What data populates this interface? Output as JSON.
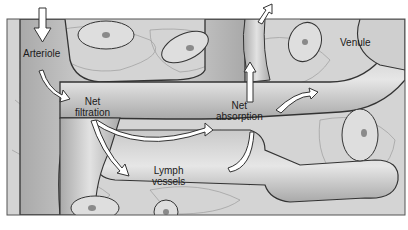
{
  "diagram": {
    "type": "capillary-bed",
    "labels": {
      "arteriole": "Arteriole",
      "net_filtration_1": "Net",
      "net_filtration_2": "filtration",
      "net_absorption_1": "Net",
      "net_absorption_2": "absorption",
      "lymph_1": "Lymph",
      "lymph_2": "vessels",
      "venule": "Venule"
    },
    "colors": {
      "tissue": "#d6d6d6",
      "vessel": "#b8b8b8",
      "outline": "#3a3a3a",
      "arrow_fill": "#ffffff",
      "nucleus": "#8a8a8a"
    }
  }
}
